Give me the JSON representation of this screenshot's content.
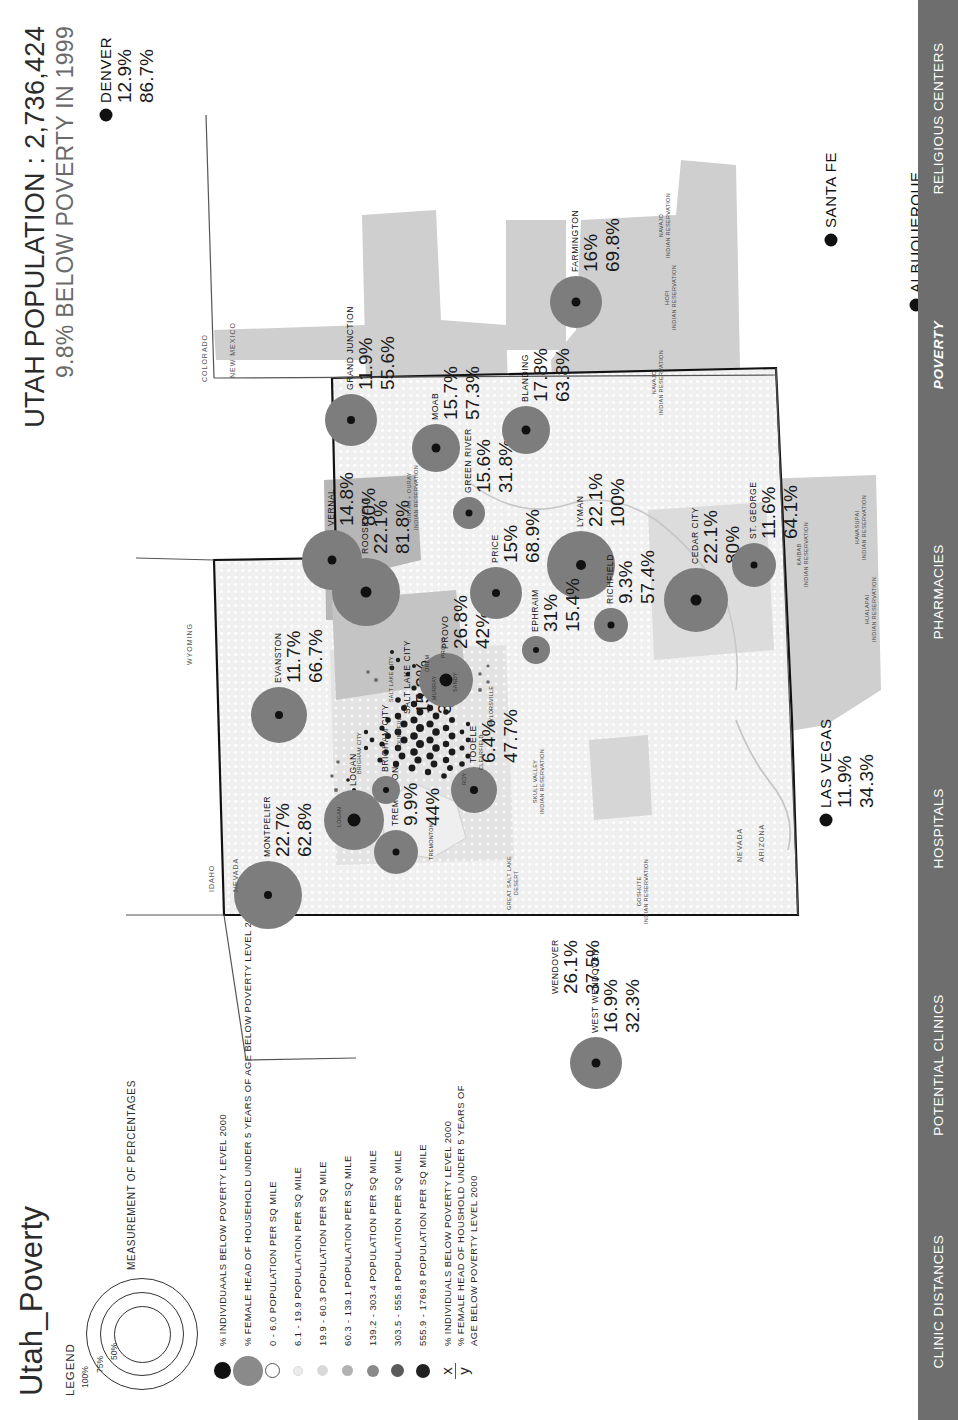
{
  "document": {
    "title": "Utah_Poverty"
  },
  "header": {
    "title_main": "UTAH POPULATION : 2,736,424",
    "title_sub": "9.8% BELOW POVERTY IN 1999"
  },
  "tabs": [
    {
      "label": "CLINIC DISTANCES",
      "active": false
    },
    {
      "label": "POTENTIAL CLINICS",
      "active": false
    },
    {
      "label": "HOSPITALS",
      "active": false
    },
    {
      "label": "PHARMACIES",
      "active": false
    },
    {
      "label": "POVERTY",
      "active": true
    },
    {
      "label": "RELIGIOUS CENTERS",
      "active": false
    }
  ],
  "legend": {
    "heading": "LEGEND",
    "ring_note": "MEASUREMENT OF PERCENTAGES",
    "ring_labels": [
      "100%",
      "75%",
      "50%"
    ],
    "rows": [
      {
        "symbol": "filled-black-circle",
        "size": 17,
        "color": "#111111",
        "label": "% INDIVIDUAALS BELOW POVERTY LEVEL  2000"
      },
      {
        "symbol": "filled-gray-circle",
        "size": 30,
        "color": "#8a8a8a",
        "label": "% FEMALE HEAD OF HOUSEHOLD UNDER 5 YEARS OF AGE BELOW POVERTY LEVEL 2000"
      },
      {
        "symbol": "open-circle",
        "size": 13,
        "color": "#ffffff",
        "label": "0 - 6.0 POPULATION PER SQ MILE"
      },
      {
        "symbol": "filled-circle",
        "size": 8,
        "color": "#ececec",
        "label": "6.1 - 19.9 POPULATION PER SQ MILE"
      },
      {
        "symbol": "filled-circle",
        "size": 9,
        "color": "#d8d8d8",
        "label": "19.9 - 60.3 POPULATION PER SQ MILE"
      },
      {
        "symbol": "filled-circle",
        "size": 11,
        "color": "#b2b2b2",
        "label": "60.3 - 139.1 POPULATION PER SQ MILE"
      },
      {
        "symbol": "filled-circle",
        "size": 12,
        "color": "#8a8a8a",
        "label": "139.2 - 303.4 POPULATION PER SQ MILE"
      },
      {
        "symbol": "filled-circle",
        "size": 13,
        "color": "#5a5a5a",
        "label": "303.5 - 555.8 POPULATION PER SQ MILE"
      },
      {
        "symbol": "filled-circle",
        "size": 14,
        "color": "#222222",
        "label": "555.9 - 1769.8 POPULATION PER SQ MILE"
      }
    ],
    "ratio": {
      "numerator_symbol": "x",
      "denominator_symbol": "y",
      "numerator_label": "% INDIVIDUALS BELOW POVERTY LEVEL 2000",
      "denominator_label": "% FEMALE HEAD OF HOUSHOLD UNDER 5 YEARS OF AGE BELOW POVERTY LEVEL 2000"
    }
  },
  "chart_data": {
    "type": "bubble-map",
    "title": "UTAH POPULATION : 2,736,424",
    "subtitle": "9.8% BELOW POVERTY IN 1999",
    "value_fields": [
      "% individuals below poverty level 2000",
      "% female head of household under 5 years of age below poverty level 2000"
    ],
    "cities": [
      {
        "name": "WEST WENDOVER",
        "v1": "16.9%",
        "v2": "32.3%",
        "x": 57,
        "y": 560,
        "bubble": 26,
        "core": 9
      },
      {
        "name": "WENDOVER",
        "v1": "26.1%",
        "v2": "37.5%",
        "x": 112,
        "y": 520,
        "bubble": 0,
        "core": 0
      },
      {
        "name": "TREMONTON",
        "v1": "9.9%",
        "v2": "44%",
        "x": 268,
        "y": 360,
        "bubble": 22,
        "core": 7
      },
      {
        "name": "LOGAN",
        "v1": "",
        "v2": "",
        "x": 300,
        "y": 318,
        "bubble": 30,
        "core": 13
      },
      {
        "name": "BRIGHAM CITY",
        "v1": "",
        "v2": "",
        "x": 330,
        "y": 350,
        "bubble": 14,
        "core": 6
      },
      {
        "name": "MONTPELIER",
        "v1": "22.7%",
        "v2": "62.8%",
        "x": 225,
        "y": 232,
        "bubble": 34,
        "core": 8
      },
      {
        "name": "EVANSTON",
        "v1": "11.7%",
        "v2": "66.7%",
        "x": 405,
        "y": 243,
        "bubble": 28,
        "core": 8
      },
      {
        "name": "SALT LAKE CITY",
        "v1": "15.3%",
        "v2": "38.4%",
        "x": 392,
        "y": 372,
        "bubble": 0,
        "core": 0
      },
      {
        "name": "TOOELE",
        "v1": "6.4%",
        "v2": "47.7%",
        "x": 330,
        "y": 438,
        "bubble": 23,
        "core": 8
      },
      {
        "name": "PROVO",
        "v1": "26.8%",
        "v2": "42%",
        "x": 440,
        "y": 410,
        "bubble": 27,
        "core": 13
      },
      {
        "name": "VERNAL",
        "v1": "14.8%",
        "v2": "80%",
        "x": 560,
        "y": 296,
        "bubble": 30,
        "core": 9
      },
      {
        "name": "ROOSEVELT",
        "v1": "22.1%",
        "v2": "81.8%",
        "x": 528,
        "y": 330,
        "bubble": 34,
        "core": 11
      },
      {
        "name": "PRICE",
        "v1": "15%",
        "v2": "68.9%",
        "x": 527,
        "y": 460,
        "bubble": 26,
        "core": 8
      },
      {
        "name": "GRAND JUNCTION",
        "v1": "11.9%",
        "v2": "55.6%",
        "x": 700,
        "y": 315,
        "bubble": 26,
        "core": 8
      },
      {
        "name": "GREEN RIVER",
        "v1": "15.6%",
        "v2": "31.8%",
        "x": 607,
        "y": 433,
        "bubble": 16,
        "core": 7
      },
      {
        "name": "MOAB",
        "v1": "15.7%",
        "v2": "57.3%",
        "x": 672,
        "y": 400,
        "bubble": 24,
        "core": 9
      },
      {
        "name": "BLANDING",
        "v1": "17.8%",
        "v2": "63.8%",
        "x": 690,
        "y": 490,
        "bubble": 24,
        "core": 9
      },
      {
        "name": "LYMAN",
        "v1": "22.1%",
        "v2": "100%",
        "x": 555,
        "y": 545,
        "bubble": 34,
        "core": 10
      },
      {
        "name": "EPHRAIM",
        "v1": "31%",
        "v2": "15.4%",
        "x": 470,
        "y": 500,
        "bubble": 14,
        "core": 6
      },
      {
        "name": "RICHFIELD",
        "v1": "9.3%",
        "v2": "57.4%",
        "x": 495,
        "y": 575,
        "bubble": 17,
        "core": 7
      },
      {
        "name": "CEDAR CITY",
        "v1": "22.1%",
        "v2": "80%",
        "x": 520,
        "y": 660,
        "bubble": 32,
        "core": 11
      },
      {
        "name": "ST. GEORGE",
        "v1": "11.6%",
        "v2": "64.1%",
        "x": 555,
        "y": 718,
        "bubble": 22,
        "core": 7
      },
      {
        "name": "FARMINGTON",
        "v1": "16%",
        "v2": "69.8%",
        "x": 818,
        "y": 540,
        "bubble": 26,
        "core": 9
      }
    ],
    "outside_cities": [
      {
        "name": "DENVER",
        "v1": "12.9%",
        "v2": "86.7%",
        "x": 1005,
        "y": 70
      },
      {
        "name": "SANTA FE",
        "v1": "",
        "v2": "",
        "x": 880,
        "y": 795
      },
      {
        "name": "ALBUQUERQUE",
        "v1": "",
        "v2": "",
        "x": 815,
        "y": 880
      },
      {
        "name": "LAS VEGAS",
        "v1": "11.9%",
        "v2": "34.3%",
        "x": 300,
        "y": 790
      }
    ],
    "geography_labels": [
      {
        "text": "IDAHO",
        "x": 228,
        "y": 172
      },
      {
        "text": "NEVADA",
        "x": 228,
        "y": 196
      },
      {
        "text": "WYOMING",
        "x": 455,
        "y": 150
      },
      {
        "text": "COLORADO",
        "x": 738,
        "y": 165
      },
      {
        "text": "NEW MEXICO",
        "x": 742,
        "y": 193
      },
      {
        "text": "NEVADA",
        "x": 258,
        "y": 700
      },
      {
        "text": "ARIZONA",
        "x": 258,
        "y": 722
      }
    ],
    "reservations": [
      {
        "text": "GOSHUTE\nINDIAN RESERVATION",
        "x": 196,
        "y": 600
      },
      {
        "text": "SKULL VALLEY\nINDIAN RESERVATION",
        "x": 306,
        "y": 496
      },
      {
        "text": "UINTAH + OURAY\nINDIAN RESERVATION",
        "x": 590,
        "y": 370
      },
      {
        "text": "NAVAJO\nINDIAN RESERVATION",
        "x": 705,
        "y": 615
      },
      {
        "text": "HOPI\nINDIAN RESERVATION",
        "x": 790,
        "y": 628
      },
      {
        "text": "NAVAJO\nINDIAN RESERVATION",
        "x": 862,
        "y": 622
      },
      {
        "text": "KAIBAB\nINDIAN RESERVATION",
        "x": 533,
        "y": 760
      },
      {
        "text": "HUALAPAI\nINDIAN RESERVATION",
        "x": 478,
        "y": 828
      },
      {
        "text": "HAVASUPAI\nINDIAN RESERVATION",
        "x": 560,
        "y": 818
      },
      {
        "text": "GREAT SALT LAKE\nDESERT",
        "x": 210,
        "y": 470
      }
    ],
    "small_towns": [
      {
        "text": "LOGAN",
        "x": 293,
        "y": 300
      },
      {
        "text": "BRIGHAM CITY",
        "x": 346,
        "y": 320
      },
      {
        "text": "TREMONTON",
        "x": 260,
        "y": 392
      },
      {
        "text": "ROY",
        "x": 335,
        "y": 425
      },
      {
        "text": "CLEARFIELD",
        "x": 350,
        "y": 442
      },
      {
        "text": "BOUNTIFUL",
        "x": 370,
        "y": 360
      },
      {
        "text": "SALT LAKE CITY",
        "x": 418,
        "y": 352
      },
      {
        "text": "TAYLORSVILLE",
        "x": 392,
        "y": 452
      },
      {
        "text": "MURRAY",
        "x": 420,
        "y": 395
      },
      {
        "text": "SANDY",
        "x": 428,
        "y": 416
      },
      {
        "text": "OREM",
        "x": 448,
        "y": 388
      },
      {
        "text": "PROVO",
        "x": 462,
        "y": 404
      }
    ]
  }
}
